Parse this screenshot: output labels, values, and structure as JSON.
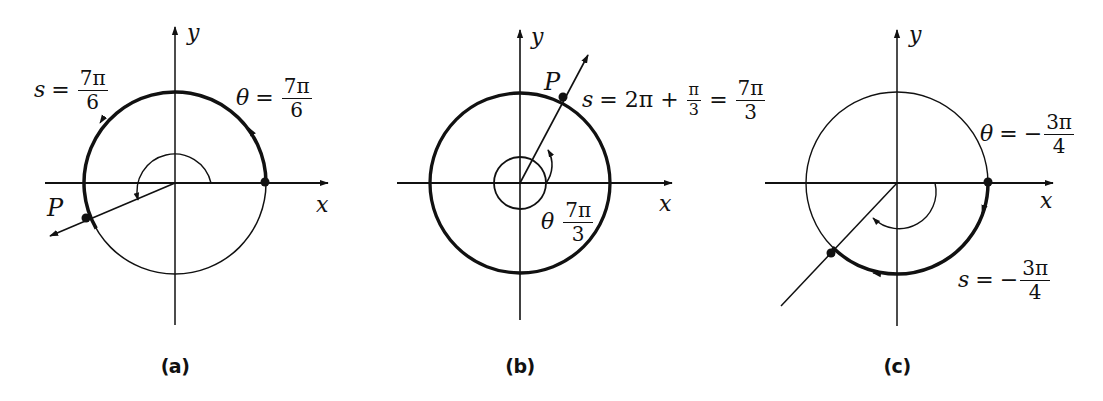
{
  "figures": [
    {
      "id": "a",
      "caption": "(a)",
      "axis_x": "x",
      "axis_y": "y",
      "point_label": "P",
      "s_label": {
        "var": "s",
        "eq": "=",
        "num": "7π",
        "den": "6"
      },
      "theta_label": {
        "var": "θ",
        "eq": "=",
        "num": "7π",
        "den": "6"
      }
    },
    {
      "id": "b",
      "caption": "(b)",
      "axis_x": "x",
      "axis_y": "y",
      "point_label": "P",
      "s_label": {
        "var": "s",
        "eq1": "= 2π +",
        "num1": "π",
        "den1": "3",
        "eq2": "=",
        "num2": "7π",
        "den2": "3"
      },
      "theta_label": {
        "var": "θ",
        "num": "7π",
        "den": "3"
      }
    },
    {
      "id": "c",
      "caption": "(c)",
      "axis_x": "x",
      "axis_y": "y",
      "theta_label": {
        "var": "θ",
        "eq": "=",
        "sign": "−",
        "num": "3π",
        "den": "4"
      },
      "s_label": {
        "var": "s",
        "eq": "=",
        "sign": "−",
        "num": "3π",
        "den": "4"
      }
    }
  ],
  "colors": {
    "ink": "#111111",
    "background": "#ffffff"
  }
}
